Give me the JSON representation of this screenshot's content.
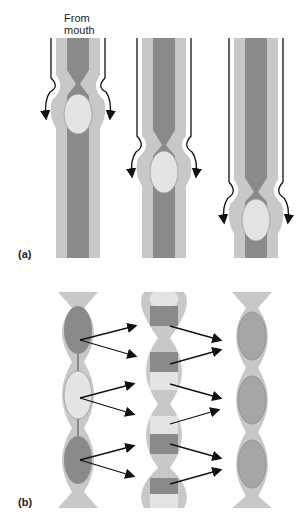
{
  "panel_a": {
    "label": "(a)",
    "from_label_line1": "From",
    "from_label_line2": "mouth",
    "description": "Peristalsis: bolus pushed down tube by progressive constriction"
  },
  "panel_b": {
    "label": "(b)",
    "description": "Segmentation: contents of segments mixed back and forth"
  },
  "colors": {
    "outer_wall": "#c8c8c8",
    "lumen_dark": "#8a8a8a",
    "bolus_light": "#e4e4e4",
    "mid_gray": "#a6a6a6",
    "arrow": "#111111"
  }
}
